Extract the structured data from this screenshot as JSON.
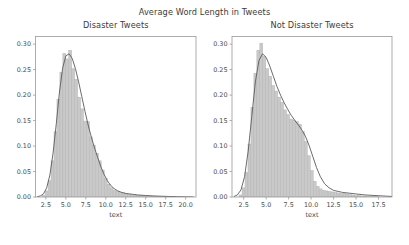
{
  "figure": {
    "suptitle": "Average Word Length in Tweets",
    "background_color": "#ffffff",
    "width": 409,
    "height": 245
  },
  "style": {
    "hist_fill": "#c9c9c9",
    "hist_edge": "#b0b0b0",
    "kde_line": "#5a5a5a",
    "axis_color": "#9a9a9a",
    "text_color": "#3c3c3c",
    "tick_color": "#4a4a4a"
  },
  "chart_data": [
    {
      "type": "bar",
      "subplot": "left",
      "title": "Disaster Tweets",
      "xlabel": "text",
      "ylabel": "",
      "grid": false,
      "legend": null,
      "xlim": [
        1.2,
        21.3
      ],
      "ylim": [
        0.0,
        0.315
      ],
      "xticks": [
        2.5,
        5.0,
        7.5,
        10.0,
        12.5,
        15.0,
        17.5,
        20.0
      ],
      "xtick_labels": [
        "2.5",
        "5.0",
        "7.5",
        "10.0",
        "12.5",
        "15.0",
        "17.5",
        "20.0"
      ],
      "yticks": [
        0.0,
        0.05,
        0.1,
        0.15,
        0.2,
        0.25,
        0.3
      ],
      "ytick_labels": [
        "0.00",
        "0.05",
        "0.10",
        "0.15",
        "0.20",
        "0.25",
        "0.30"
      ],
      "bin_width": 0.37,
      "x": [
        2.22,
        2.59,
        2.96,
        3.33,
        3.7,
        4.07,
        4.44,
        4.81,
        5.18,
        5.55,
        5.92,
        6.29,
        6.66,
        7.03,
        7.4,
        7.77,
        8.14,
        8.51,
        8.88,
        9.25,
        9.62,
        9.99,
        10.36,
        10.73,
        11.1,
        11.47,
        11.84,
        12.21,
        12.58,
        12.95,
        13.32,
        13.69,
        14.06,
        14.43,
        14.8,
        15.17,
        15.54,
        15.91,
        16.28,
        16.65,
        17.02,
        17.39,
        17.76,
        18.13,
        18.5,
        18.87,
        19.24,
        19.61,
        19.98,
        20.35
      ],
      "values": [
        0.003,
        0.012,
        0.032,
        0.071,
        0.128,
        0.192,
        0.245,
        0.282,
        0.271,
        0.288,
        0.252,
        0.231,
        0.196,
        0.173,
        0.149,
        0.148,
        0.118,
        0.102,
        0.086,
        0.071,
        0.053,
        0.036,
        0.025,
        0.018,
        0.013,
        0.011,
        0.009,
        0.008,
        0.006,
        0.005,
        0.004,
        0.004,
        0.003,
        0.003,
        0.002,
        0.002,
        0.002,
        0.002,
        0.001,
        0.001,
        0.001,
        0.001,
        0.001,
        0.001,
        0.001,
        0.0,
        0.0,
        0.0,
        0.0,
        0.0
      ],
      "kde_x": [
        1.4,
        1.8,
        2.2,
        2.6,
        3.0,
        3.4,
        3.8,
        4.2,
        4.6,
        5.0,
        5.4,
        5.8,
        6.2,
        6.6,
        7.0,
        7.4,
        7.8,
        8.2,
        8.6,
        9.0,
        9.4,
        9.8,
        10.2,
        10.6,
        11.0,
        11.5,
        12.0,
        12.5,
        13.0,
        13.5,
        14.0,
        15.0,
        16.0,
        17.0,
        18.0,
        19.0,
        20.0,
        21.0
      ],
      "kde_y": [
        0.0005,
        0.002,
        0.006,
        0.018,
        0.043,
        0.086,
        0.143,
        0.206,
        0.253,
        0.277,
        0.281,
        0.272,
        0.252,
        0.226,
        0.197,
        0.168,
        0.141,
        0.117,
        0.096,
        0.077,
        0.059,
        0.044,
        0.032,
        0.023,
        0.017,
        0.012,
        0.009,
        0.007,
        0.006,
        0.005,
        0.004,
        0.003,
        0.002,
        0.0015,
        0.001,
        0.0007,
        0.0004,
        0.0002
      ]
    },
    {
      "type": "bar",
      "subplot": "right",
      "title": "Not Disaster Tweets",
      "xlabel": "text",
      "ylabel": "",
      "grid": false,
      "legend": null,
      "xlim": [
        1.2,
        19.0
      ],
      "ylim": [
        0.0,
        0.315
      ],
      "xticks": [
        2.5,
        5.0,
        7.5,
        10.0,
        12.5,
        15.0,
        17.5
      ],
      "xtick_labels": [
        "2.5",
        "5.0",
        "7.5",
        "10.0",
        "12.5",
        "15.0",
        "17.5"
      ],
      "yticks": [
        0.0,
        0.05,
        0.1,
        0.15,
        0.2,
        0.25,
        0.3
      ],
      "ytick_labels": [
        "0.00",
        "0.05",
        "0.10",
        "0.15",
        "0.20",
        "0.25",
        "0.30"
      ],
      "bin_width": 0.33,
      "x": [
        2.15,
        2.48,
        2.81,
        3.14,
        3.47,
        3.8,
        4.13,
        4.46,
        4.79,
        5.12,
        5.45,
        5.78,
        6.11,
        6.44,
        6.77,
        7.1,
        7.43,
        7.76,
        8.09,
        8.42,
        8.75,
        9.08,
        9.41,
        9.74,
        10.07,
        10.4,
        10.73,
        11.06,
        11.39,
        11.72,
        12.05,
        12.38,
        12.71,
        13.04,
        13.37,
        13.7,
        14.03,
        14.36,
        14.69,
        15.02,
        15.35,
        15.68,
        16.01,
        16.34,
        16.67,
        17.0,
        17.33,
        17.66,
        17.99,
        18.32
      ],
      "values": [
        0.004,
        0.018,
        0.048,
        0.104,
        0.176,
        0.243,
        0.288,
        0.302,
        0.276,
        0.252,
        0.237,
        0.219,
        0.208,
        0.196,
        0.186,
        0.171,
        0.162,
        0.153,
        0.151,
        0.148,
        0.143,
        0.128,
        0.109,
        0.081,
        0.052,
        0.031,
        0.021,
        0.016,
        0.013,
        0.012,
        0.011,
        0.01,
        0.009,
        0.008,
        0.007,
        0.007,
        0.006,
        0.005,
        0.004,
        0.003,
        0.003,
        0.002,
        0.002,
        0.001,
        0.001,
        0.001,
        0.001,
        0.0,
        0.0,
        0.0
      ],
      "kde_x": [
        1.4,
        1.8,
        2.2,
        2.6,
        3.0,
        3.4,
        3.8,
        4.2,
        4.6,
        5.0,
        5.4,
        5.8,
        6.2,
        6.6,
        7.0,
        7.4,
        7.8,
        8.2,
        8.6,
        9.0,
        9.4,
        9.8,
        10.2,
        10.6,
        11.0,
        11.5,
        12.0,
        12.5,
        13.0,
        13.5,
        14.0,
        15.0,
        16.0,
        17.0,
        18.0,
        19.0
      ],
      "kde_y": [
        0.0008,
        0.004,
        0.014,
        0.04,
        0.09,
        0.158,
        0.226,
        0.268,
        0.281,
        0.274,
        0.257,
        0.237,
        0.217,
        0.2,
        0.185,
        0.172,
        0.16,
        0.15,
        0.141,
        0.131,
        0.118,
        0.1,
        0.079,
        0.058,
        0.041,
        0.026,
        0.018,
        0.013,
        0.011,
        0.009,
        0.008,
        0.006,
        0.004,
        0.003,
        0.002,
        0.001
      ]
    }
  ]
}
